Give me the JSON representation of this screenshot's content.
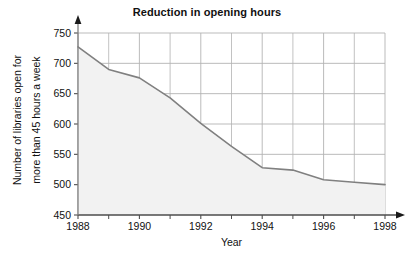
{
  "chart_data": {
    "type": "area",
    "title": "Reduction in opening hours",
    "xlabel": "Year",
    "ylabel": "Number of libraries open for more than 45 hours a week",
    "ylabel_lines": [
      "Number of libraries open for",
      "more than 45 hours a week"
    ],
    "x": [
      1988,
      1989,
      1990,
      1991,
      1992,
      1993,
      1994,
      1995,
      1996,
      1997,
      1998
    ],
    "values": [
      727,
      690,
      676,
      643,
      601,
      563,
      528,
      524,
      508,
      504,
      500
    ],
    "series": [
      {
        "name": "Number of libraries open for more than 45 hours a week",
        "values": [
          727,
          690,
          676,
          643,
          601,
          563,
          528,
          524,
          508,
          504,
          500
        ]
      }
    ],
    "xlim": [
      1988,
      1998
    ],
    "ylim": [
      450,
      750
    ],
    "yticks": [
      450,
      500,
      550,
      600,
      650,
      700,
      750
    ],
    "ytick_labels": [
      "450",
      "500",
      "550",
      "600",
      "650",
      "700",
      "750"
    ],
    "xticks": [
      1988,
      1990,
      1992,
      1994,
      1996,
      1998
    ],
    "xtick_labels": [
      "1988",
      "1990",
      "1992",
      "1994",
      "1996",
      "1998"
    ],
    "xticks_minor": [
      1989,
      1991,
      1993,
      1995,
      1997
    ],
    "grid": true,
    "legend": false,
    "legend_position": "none",
    "colors": {
      "line": "#808080",
      "fill": "#f2f2f2",
      "grid": "#b3b3b3",
      "axis": "#4d4d4d",
      "text": "#111111",
      "background": "#ffffff"
    }
  }
}
